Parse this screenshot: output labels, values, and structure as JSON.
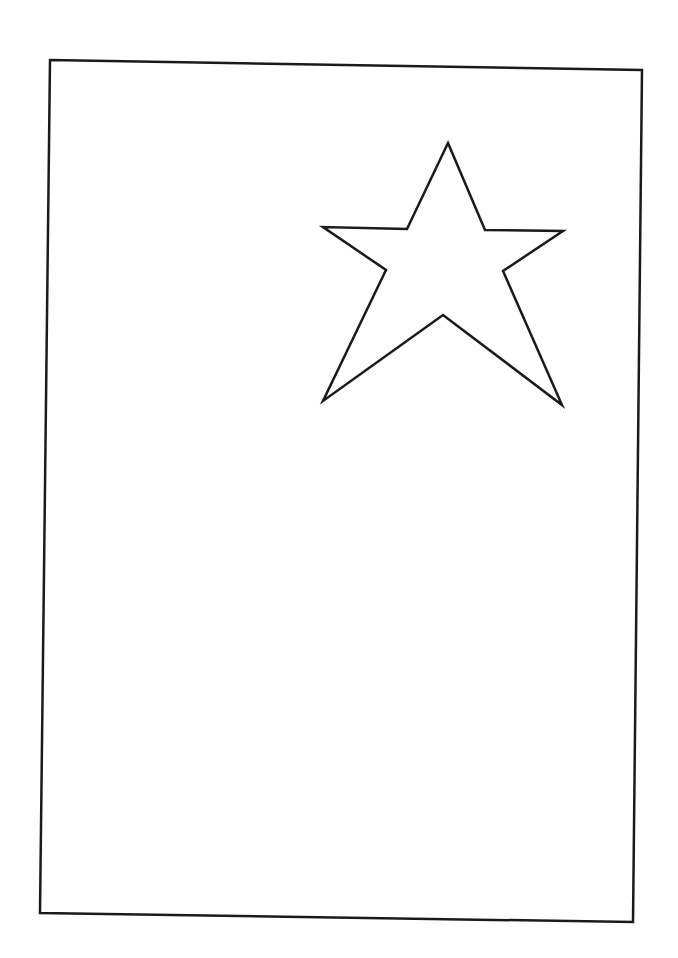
{
  "page": {
    "background": "#ffffff",
    "width": 678,
    "height": 958
  },
  "frame": {
    "label": "rectangular-border",
    "stroke": "#1a1a1a",
    "stroke_width": 2.5,
    "points": [
      [
        50,
        60
      ],
      [
        642,
        70
      ],
      [
        633,
        922
      ],
      [
        40,
        913
      ]
    ]
  },
  "star": {
    "label": "five-pointed-star-outline",
    "stroke": "#1a1a1a",
    "stroke_width": 2.5,
    "fill": "#ffffff",
    "points": [
      [
        448,
        143
      ],
      [
        485,
        230
      ],
      [
        563,
        231
      ],
      [
        503,
        271
      ],
      [
        562,
        405
      ],
      [
        443,
        315
      ],
      [
        323,
        401
      ],
      [
        386,
        270
      ],
      [
        323,
        227
      ],
      [
        407,
        229
      ]
    ]
  }
}
